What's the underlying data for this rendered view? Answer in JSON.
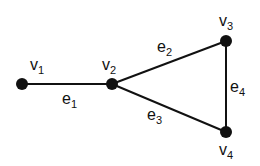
{
  "diagram": {
    "type": "graph",
    "vertices": [
      {
        "id": "v1",
        "label": "v",
        "sub": "1",
        "x": 22,
        "y": 84
      },
      {
        "id": "v2",
        "label": "v",
        "sub": "2",
        "x": 112,
        "y": 84
      },
      {
        "id": "v3",
        "label": "v",
        "sub": "3",
        "x": 226,
        "y": 41
      },
      {
        "id": "v4",
        "label": "v",
        "sub": "4",
        "x": 226,
        "y": 132
      }
    ],
    "edges": [
      {
        "id": "e1",
        "label": "e",
        "sub": "1",
        "from": "v1",
        "to": "v2"
      },
      {
        "id": "e2",
        "label": "e",
        "sub": "2",
        "from": "v2",
        "to": "v3"
      },
      {
        "id": "e3",
        "label": "e",
        "sub": "3",
        "from": "v2",
        "to": "v4"
      },
      {
        "id": "e4",
        "label": "e",
        "sub": "4",
        "from": "v3",
        "to": "v4"
      }
    ]
  }
}
